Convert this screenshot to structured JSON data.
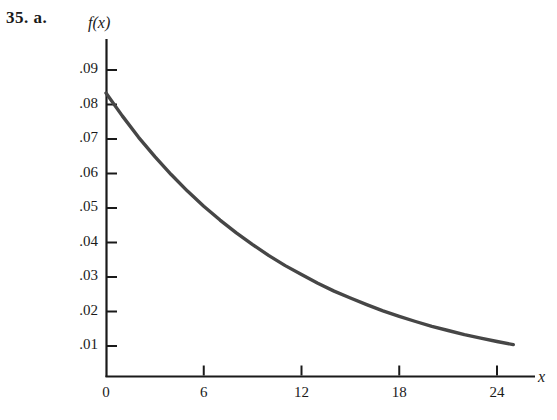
{
  "figure": {
    "problem_label": "35.  a.",
    "axis_x_name": "x",
    "axis_y_name": "f(x)"
  },
  "chart_data": {
    "type": "line",
    "title": "",
    "subtitle": "",
    "xlabel": "x",
    "ylabel": "f(x)",
    "legend": [],
    "grid": false,
    "xlim": [
      0,
      26.3
    ],
    "ylim": [
      0,
      0.0955
    ],
    "xticks": [
      0,
      6,
      12,
      18,
      24
    ],
    "xtick_labels": [
      "0",
      "6",
      "12",
      "18",
      "24"
    ],
    "yticks": [
      0.01,
      0.02,
      0.03,
      0.04,
      0.05,
      0.06,
      0.07,
      0.08,
      0.09
    ],
    "ytick_labels": [
      ".01",
      ".02",
      ".03",
      ".04",
      ".05",
      ".06",
      ".07",
      ".08",
      ".09"
    ],
    "series": [
      {
        "name": "f(x)",
        "color": "#464646",
        "linewidth": 3.4,
        "x": [
          0,
          1,
          2,
          3,
          4,
          5,
          6,
          7,
          8,
          9,
          10,
          11,
          12,
          13,
          14,
          15,
          16,
          17,
          18,
          19,
          20,
          21,
          22,
          23,
          24,
          25
        ],
        "y": [
          0.0833,
          0.0767,
          0.0705,
          0.0649,
          0.0597,
          0.0549,
          0.0505,
          0.0465,
          0.0428,
          0.0394,
          0.0362,
          0.0333,
          0.0307,
          0.0282,
          0.0259,
          0.0239,
          0.022,
          0.0202,
          0.0186,
          0.0171,
          0.0157,
          0.0145,
          0.0133,
          0.0123,
          0.0113,
          0.0104
        ]
      }
    ]
  }
}
